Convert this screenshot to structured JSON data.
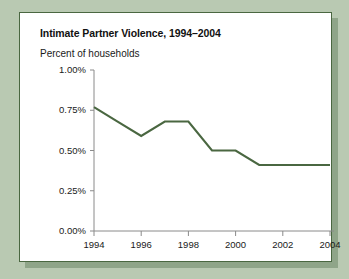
{
  "page": {
    "background_color": "#b9c9b2"
  },
  "card": {
    "background_color": "#ffffff",
    "border_color": "#4a6741",
    "shadow_color": "#8fa589"
  },
  "chart_data": {
    "type": "line",
    "title": "Intimate Partner Violence, 1994–2004",
    "subtitle": "Percent of households",
    "xlabel": "",
    "ylabel": "",
    "line_color": "#4a6741",
    "grid": false,
    "legend": "none",
    "x": [
      1994,
      1995,
      1996,
      1997,
      1998,
      1999,
      2000,
      2001,
      2002,
      2003,
      2004
    ],
    "values": [
      0.77,
      0.68,
      0.59,
      0.68,
      0.68,
      0.5,
      0.5,
      0.41,
      0.41,
      0.41,
      0.41
    ],
    "xlim": [
      1994,
      2004
    ],
    "ylim": [
      0.0,
      1.0
    ],
    "ytick_values": [
      0.0,
      0.25,
      0.5,
      0.75,
      1.0
    ],
    "ytick_labels": [
      "0.00%",
      "0.25%",
      "0.50%",
      "0.75%",
      "1.00%"
    ],
    "xtick_values": [
      1994,
      1996,
      1998,
      2000,
      2002,
      2004
    ],
    "xtick_labels": [
      "1994",
      "1996",
      "1998",
      "2000",
      "2002",
      "2004"
    ]
  }
}
